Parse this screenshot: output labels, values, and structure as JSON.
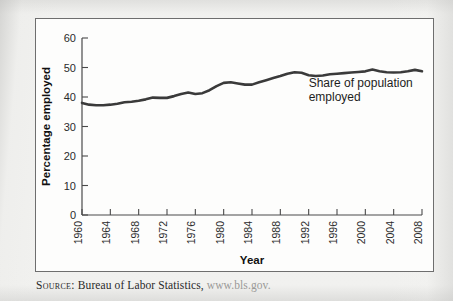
{
  "figure": {
    "source_label": "Source:",
    "source_text": " Bureau of Labor Statistics, ",
    "source_url": "www.bls.gov."
  },
  "chart_data": {
    "type": "line",
    "title": "",
    "xlabel": "Year",
    "ylabel": "Percentage employed",
    "xlim": [
      1960,
      2008
    ],
    "ylim": [
      0,
      60
    ],
    "ytick_labels": [
      "0",
      "10",
      "20",
      "30",
      "40",
      "50",
      "60"
    ],
    "ytick_values": [
      0,
      10,
      20,
      30,
      40,
      50,
      60
    ],
    "xtick_labels": [
      "1960",
      "1964",
      "1968",
      "1972",
      "1976",
      "1980",
      "1984",
      "1988",
      "1992",
      "1996",
      "2000",
      "2004",
      "2008"
    ],
    "xtick_values": [
      1960,
      1964,
      1968,
      1972,
      1976,
      1980,
      1984,
      1988,
      1992,
      1996,
      2000,
      2004,
      2008
    ],
    "grid": false,
    "legend_position": "none",
    "line_color": "#3a3a3a",
    "annotations": [
      {
        "name": "series-annotation",
        "lines": [
          "Share of population",
          "employed"
        ],
        "x": 1992,
        "y": 43.5
      }
    ],
    "series": [
      {
        "name": "Share of population employed",
        "x": [
          1960,
          1961,
          1962,
          1963,
          1964,
          1965,
          1966,
          1967,
          1968,
          1969,
          1970,
          1971,
          1972,
          1973,
          1974,
          1975,
          1976,
          1977,
          1978,
          1979,
          1980,
          1981,
          1982,
          1983,
          1984,
          1985,
          1986,
          1987,
          1988,
          1989,
          1990,
          1991,
          1992,
          1993,
          1994,
          1995,
          1996,
          1997,
          1998,
          1999,
          2000,
          2001,
          2002,
          2003,
          2004,
          2005,
          2006,
          2007,
          2008
        ],
        "values": [
          38.0,
          37.4,
          37.2,
          37.2,
          37.4,
          37.7,
          38.2,
          38.4,
          38.7,
          39.2,
          39.8,
          39.7,
          39.7,
          40.3,
          41.0,
          41.5,
          41.0,
          41.3,
          42.3,
          43.7,
          44.8,
          45.0,
          44.6,
          44.2,
          44.2,
          45.0,
          45.7,
          46.4,
          47.1,
          47.9,
          48.4,
          48.2,
          47.4,
          47.1,
          47.3,
          47.7,
          47.9,
          48.1,
          48.3,
          48.5,
          48.7,
          49.3,
          48.7,
          48.4,
          48.3,
          48.4,
          48.7,
          49.2,
          48.7
        ]
      }
    ]
  }
}
